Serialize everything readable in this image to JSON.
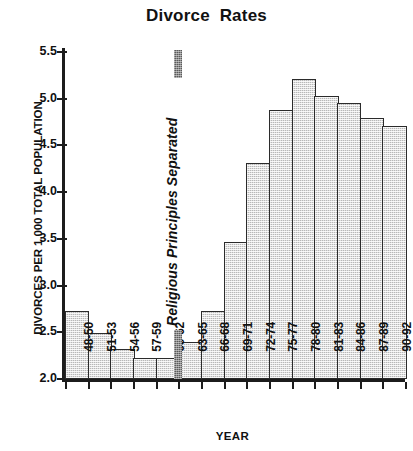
{
  "chart_data": {
    "type": "bar",
    "title": "Divorce  Rates",
    "xlabel": "YEAR",
    "ylabel": "DIVORCES PER 1,000 TOTAL POPULATION",
    "categories": [
      "48-50",
      "51-53",
      "54-56",
      "57-59",
      "60-62",
      "63-65",
      "66-68",
      "69-71",
      "72-74",
      "75-77",
      "78-80",
      "81-83",
      "84-86",
      "87-89",
      "90-92"
    ],
    "values": [
      2.73,
      2.49,
      2.32,
      2.23,
      2.23,
      2.4,
      2.73,
      3.47,
      4.31,
      4.88,
      5.21,
      5.03,
      4.95,
      4.79,
      4.71
    ],
    "ylim": [
      2.0,
      5.5
    ],
    "ytick_labels": [
      "5.5",
      "5.0",
      "4.5",
      "4.0",
      "3.5",
      "3.0",
      "2.5",
      "2.0"
    ],
    "ytick_values": [
      5.5,
      5.0,
      4.5,
      4.0,
      3.5,
      3.0,
      2.5,
      2.0
    ],
    "grid": false,
    "legend": false,
    "annotations": [
      {
        "text": "Religious Principles Separated",
        "at_category_boundary": "60-62 / 63-65",
        "style": "vertical bold italic with hatched marker bar"
      }
    ],
    "bar_fill": "#b8b8b8",
    "bar_edge": "#2b2b2b",
    "marker_color": "#5a5a5a",
    "background": "#ffffff"
  }
}
